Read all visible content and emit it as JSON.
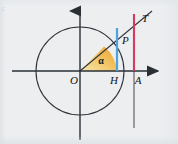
{
  "figure": {
    "kind": "unit-circle-trigonometry-diagram",
    "background_color": "#eceef0",
    "stroke_color": "#2a2f35",
    "corner_mark": "c",
    "labels": {
      "origin": "O",
      "foot": "H",
      "axis_point": "A",
      "circle_point": "P",
      "tangent_point": "T",
      "angle": "α"
    },
    "segments": {
      "cosine": {
        "name": "OH",
        "color": "#7ec13a",
        "from": "O",
        "to": "H"
      },
      "sine": {
        "name": "HP",
        "color": "#4da3e0",
        "from": "H",
        "to": "P"
      },
      "tangent": {
        "name": "AT",
        "color": "#d63a63",
        "from": "A",
        "to": "T"
      },
      "angle_sector": {
        "name": "alpha-sector",
        "color_start": "#f0a024",
        "color_end": "#f7e9b0"
      }
    },
    "geometry": {
      "origin_x": 80,
      "origin_y": 71,
      "radius": 44,
      "point_p_x": 117,
      "point_p_y": 47,
      "point_h_x": 117,
      "point_h_y": 71,
      "point_a_x": 134,
      "point_a_y": 71,
      "point_t_x": 134,
      "point_t_y": 19,
      "x_axis_left": 12,
      "x_axis_right": 164,
      "y_axis_top": 6,
      "y_axis_bottom": 140,
      "ray_end_x": 152,
      "ray_end_y": 11
    }
  }
}
